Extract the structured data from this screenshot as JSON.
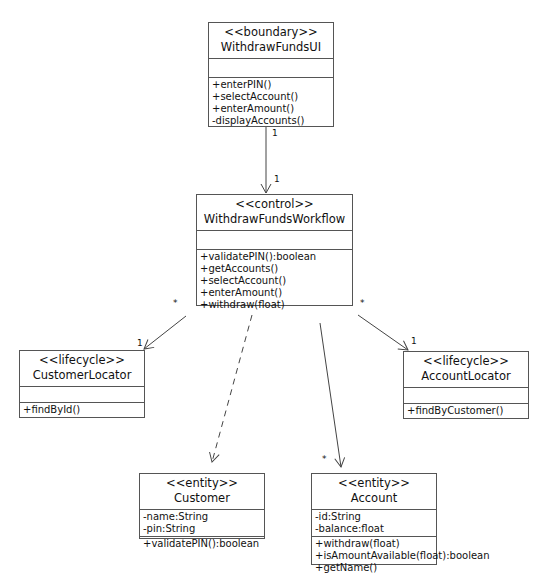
{
  "classes": {
    "withdrawFundsUI": {
      "stereotype": "<<boundary>>",
      "name": "WithdrawFundsUI",
      "attributes": [],
      "methods": [
        "+enterPIN()",
        "+selectAccount()",
        "+enterAmount()",
        "-displayAccounts()"
      ]
    },
    "withdrawFundsWorkflow": {
      "stereotype": "<<control>>",
      "name": "WithdrawFundsWorkflow",
      "attributes": [],
      "methods": [
        "+validatePIN():boolean",
        "+getAccounts()",
        "+selectAccount()",
        "+enterAmount()",
        "+withdraw(float)"
      ]
    },
    "customerLocator": {
      "stereotype": "<<lifecycle>>",
      "name": "CustomerLocator",
      "attributes": [],
      "methods": [
        "+findById()"
      ]
    },
    "accountLocator": {
      "stereotype": "<<lifecycle>>",
      "name": "AccountLocator",
      "attributes": [],
      "methods": [
        "+findByCustomer()"
      ]
    },
    "customer": {
      "stereotype": "<<entity>>",
      "name": "Customer",
      "attributes": [
        "-name:String",
        "-pin:String"
      ],
      "methods": [
        "+validatePIN():boolean"
      ]
    },
    "account": {
      "stereotype": "<<entity>>",
      "name": "Account",
      "attributes": [
        "-id:String",
        "-balance:float"
      ],
      "methods": [
        "+withdraw(float)",
        "+isAmountAvailable(float):boolean",
        "+getName()"
      ]
    }
  },
  "relationships": [
    {
      "from": "WithdrawFundsUI",
      "to": "WithdrawFundsWorkflow",
      "type": "association",
      "from_mult": "1",
      "to_mult": "1"
    },
    {
      "from": "WithdrawFundsWorkflow",
      "to": "CustomerLocator",
      "type": "association",
      "from_mult": "*",
      "to_mult": "1"
    },
    {
      "from": "WithdrawFundsWorkflow",
      "to": "AccountLocator",
      "type": "association",
      "from_mult": "*",
      "to_mult": "1"
    },
    {
      "from": "WithdrawFundsWorkflow",
      "to": "Customer",
      "type": "dependency"
    },
    {
      "from": "WithdrawFundsWorkflow",
      "to": "Account",
      "type": "association",
      "to_mult": "*"
    }
  ],
  "multiplicities": {
    "ui_to_workflow_top": "1",
    "ui_to_workflow_bottom": "1",
    "workflow_customerlocator_src": "*",
    "workflow_customerlocator_dst": "1",
    "workflow_accountlocator_src": "*",
    "workflow_accountlocator_dst": "1",
    "workflow_account_dst": "*"
  },
  "colors": {
    "line": "#555555",
    "background": "#ffffff",
    "text": "#111111"
  }
}
